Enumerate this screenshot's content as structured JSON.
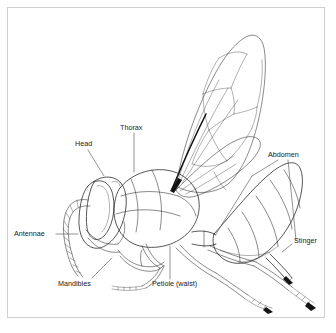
{
  "figure": {
    "title": "",
    "caption": "",
    "background_color": "#ffffff",
    "ink_color": "#1d1d1d",
    "frame_color": "#cfcfcf"
  },
  "labels": {
    "head": "Head",
    "thorax": "Thorax",
    "abdomen": "Abdomen",
    "antennae": "Antennae",
    "mandibles": "Mandibles",
    "petiole": "Petiole (waist)",
    "stinger": "Stinger"
  },
  "label_positions": [
    {
      "key": "head",
      "x": 75,
      "y": 146,
      "anchor": "start"
    },
    {
      "key": "thorax",
      "x": 120,
      "y": 130,
      "anchor": "start"
    },
    {
      "key": "abdomen",
      "x": 268,
      "y": 157,
      "anchor": "start"
    },
    {
      "key": "antennae",
      "x": 14,
      "y": 236,
      "anchor": "start"
    },
    {
      "key": "mandibles",
      "x": 58,
      "y": 286,
      "anchor": "start"
    },
    {
      "key": "petiole",
      "x": 152,
      "y": 286,
      "anchor": "start"
    },
    {
      "key": "stinger",
      "x": 294,
      "y": 243,
      "anchor": "start"
    }
  ],
  "parts": [
    "head",
    "thorax",
    "abdomen",
    "antennae",
    "mandibles",
    "petiole",
    "stinger",
    "forewing",
    "hindwing",
    "compound eye",
    "legs"
  ]
}
